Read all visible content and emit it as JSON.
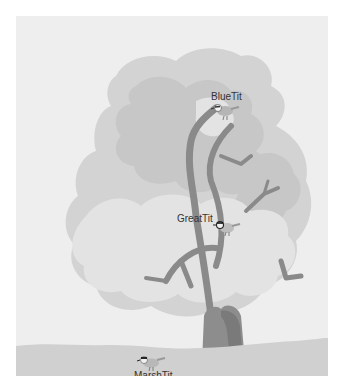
{
  "scene": {
    "description": "Grayscale illustration of a tree with three labeled birds",
    "colors": {
      "background": "#eeeeee",
      "ground": "#cfcfcf",
      "foliage_light": "#e2e2e2",
      "foliage_mid": "#d2d2d2",
      "foliage_dark": "#c4c4c4",
      "trunk": "#8c8c8c",
      "trunk_dark": "#777777",
      "branch": "#8a8a8a",
      "label_text": "#333333"
    }
  },
  "birds": [
    {
      "name": "BlueTit",
      "label": "BlueTit",
      "position": "top of tree"
    },
    {
      "name": "GreatTit",
      "label": "GreatTit",
      "position": "middle of tree"
    },
    {
      "name": "MarshTit",
      "label": "MarshTit",
      "position": "on ground"
    }
  ]
}
